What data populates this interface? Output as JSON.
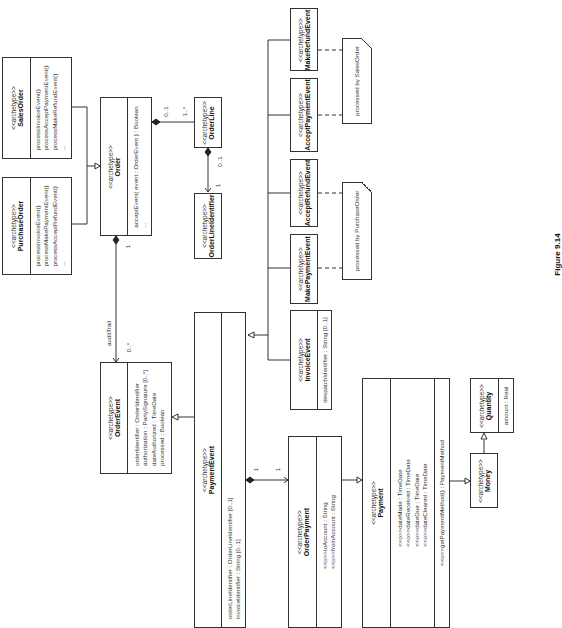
{
  "stereotype": "<<archetype>>",
  "classes": {
    "sales_order": {
      "name": "SalesOrder",
      "operations": [
        "processInvoiceEvent()",
        "processAcceptPaymentEvent()",
        "processMakeRefundEvent()",
        "..."
      ]
    },
    "purchase_order": {
      "name": "PurchaseOrder",
      "operations": [
        "processInvoiceEvent()",
        "processMakePaymentEvent()",
        "processAcceptRefundEvent()",
        "..."
      ]
    },
    "order": {
      "name": "Order",
      "operations": [
        "acceptEvent( event : OrderEvent ) : Boolean",
        "..."
      ]
    },
    "order_line": {
      "name": "OrderLine"
    },
    "order_line_identifier": {
      "name": "OrderLineIdentifier"
    },
    "order_event": {
      "name": "OrderEvent",
      "attributes": [
        "orderIdentifier : OrderIdentifier",
        "authorization : PartySignature [0..*]",
        "dateAuthorized : TimeDate",
        "processed : Boolean"
      ]
    },
    "payment_event": {
      "name": "PaymentEvent",
      "attributes": [
        "orderLineIdentifier : OrderLineIdentifier [0..1]",
        "invoiceIdentifier : String [0..1]"
      ]
    },
    "invoice_event": {
      "name": "InvoiceEvent",
      "attributes": [
        "despatchIdentifier : String [0..1]"
      ]
    },
    "make_payment_event": {
      "name": "MakePaymentEvent"
    },
    "accept_refund_event": {
      "name": "AcceptRefundEvent"
    },
    "accept_payment_event": {
      "name": "AcceptPaymentEvent"
    },
    "make_refund_event": {
      "name": "MakeRefundEvent"
    },
    "order_payment": {
      "name": "OrderPayment",
      "attributes": [
        "<<o>>toAccount : String",
        "<<o>>fromAccount : String"
      ]
    },
    "payment": {
      "name": "Payment",
      "attributes": [
        "<<o>>dateMade : TimeDate",
        "<<o>>dateReceived : TimeDate",
        "<<o>>dateDue : TimeDate",
        "<<o>>dateCleared : TimeDate"
      ],
      "operations": [
        "<<o>>getPaymentMethod() : PaymentMethod"
      ]
    },
    "money": {
      "name": "Money"
    },
    "quantity": {
      "name": "Quantity",
      "attributes": [
        "amount : Real"
      ]
    }
  },
  "notes": {
    "sales": "processed by SalesOrder",
    "purchase": "processed by PurchaseOrder"
  },
  "labels": {
    "order_orderline_src": "0..1",
    "order_orderline_dst": "1..*",
    "orderline_identifier_src": "0..1",
    "orderline_identifier_dst": "1",
    "order_audit_src": "1",
    "audit_role": "auditTrail",
    "audit_mult": "0..*",
    "payment_event_src": "1",
    "payment_event_dst": "1"
  },
  "caption": "Figure 9.14"
}
